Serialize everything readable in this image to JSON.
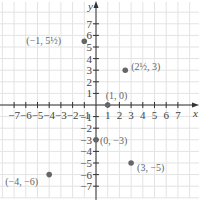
{
  "chart_data": {
    "type": "scatter",
    "title": "",
    "xlabel": "x",
    "ylabel": "y",
    "xlim": [
      -8,
      8
    ],
    "ylim": [
      -8,
      8
    ],
    "grid": true,
    "x_ticks": [
      -7,
      -6,
      -5,
      -4,
      -3,
      -2,
      -1,
      1,
      2,
      3,
      4,
      5,
      6,
      7
    ],
    "y_ticks": [
      -7,
      -6,
      -5,
      -4,
      -3,
      -2,
      -1,
      1,
      2,
      3,
      4,
      5,
      6,
      7
    ],
    "points": [
      {
        "x": -1,
        "y": 5.5,
        "label": "(−1, 5½)"
      },
      {
        "x": 2.5,
        "y": 3,
        "label": "(2½, 3)"
      },
      {
        "x": 1,
        "y": 0,
        "label": "(1, 0)"
      },
      {
        "x": 0,
        "y": -3,
        "label": "(0, −3)"
      },
      {
        "x": 3,
        "y": -5,
        "label": "(3, −5)"
      },
      {
        "x": -4,
        "y": -6,
        "label": "(−4, −6)"
      }
    ]
  },
  "colors": {
    "point": "#666666",
    "axis": "#333333",
    "grid": "#e3e3e3"
  }
}
